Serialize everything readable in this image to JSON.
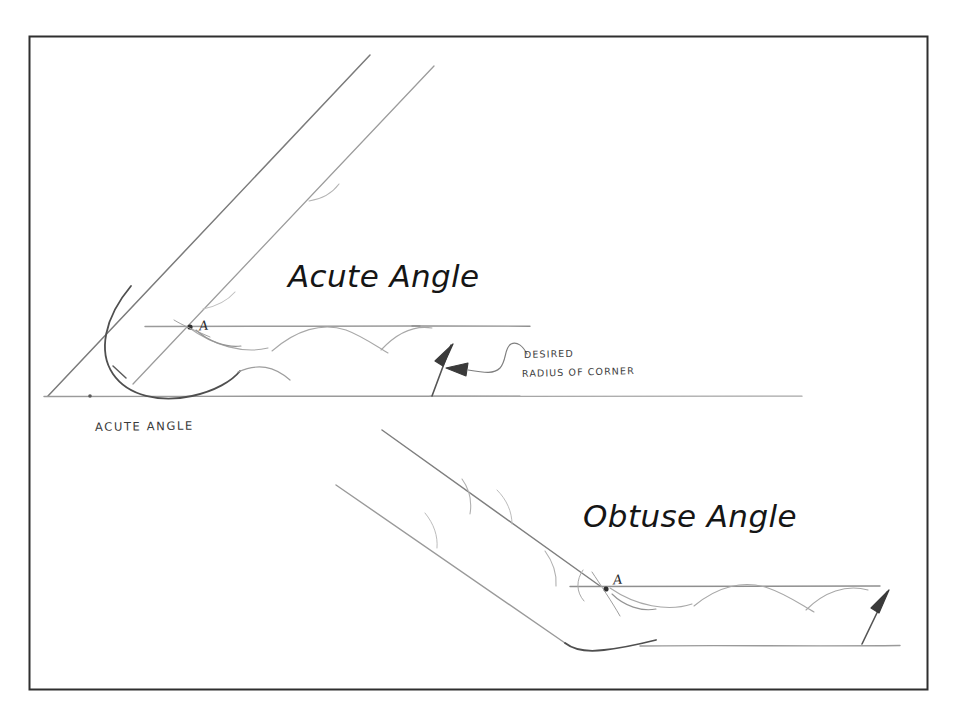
{
  "page": {
    "background_color": "#ffffff",
    "width": 954,
    "height": 718
  },
  "frame": {
    "name": "drawing-border",
    "color": "#2f2f2f",
    "x": 29,
    "y": 36,
    "width": 899,
    "height": 654
  },
  "ink": {
    "line_color": "#8d8d8d",
    "dark_line_color": "#4a4a4a",
    "arc_color": "#5c5c5c",
    "text_color": "#1d1d1d"
  },
  "diagrams": [
    {
      "id": "acute",
      "title": "Acute Angle",
      "caption": "ACUTE ANGLE",
      "vertex_label": "A",
      "angle_type": "acute"
    },
    {
      "id": "obtuse",
      "title": "Obtuse Angle",
      "caption": "",
      "vertex_label": "A",
      "angle_type": "obtuse"
    }
  ],
  "annotation": {
    "line1": "DESIRED",
    "line2": "RADIUS OF CORNER"
  },
  "titles": {
    "acute": "Acute Angle",
    "obtuse": "Obtuse Angle"
  },
  "captions": {
    "acute": "ACUTE ANGLE"
  },
  "vertices": {
    "acute": "A",
    "obtuse": "A"
  }
}
